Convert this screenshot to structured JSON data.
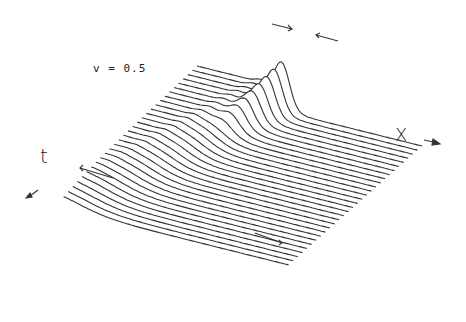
{
  "chart_data": {
    "type": "line",
    "title": "",
    "annotation": "v = 0.5",
    "xlabel": "X",
    "ylabel": "t",
    "style": "3D waterfall (stacked profiles over time)",
    "num_profiles": 30,
    "arrows": [
      {
        "label": "pulse-left-edge",
        "direction": "right"
      },
      {
        "label": "pulse-right-edge",
        "direction": "left"
      },
      {
        "label": "t-axis-front",
        "direction": "up-left"
      },
      {
        "label": "front-position",
        "direction": "right"
      }
    ],
    "line_color": "#333333"
  },
  "labels": {
    "parameter": "v = 0.5",
    "x_axis": "X",
    "t_axis": "t"
  }
}
